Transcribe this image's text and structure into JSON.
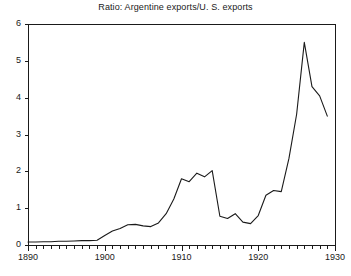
{
  "chart_data": {
    "type": "line",
    "title": "Ratio: Argentine exports/U. S. exports",
    "xlabel": "",
    "ylabel": "",
    "xlim": [
      1890,
      1930
    ],
    "ylim": [
      0,
      6
    ],
    "grid": false,
    "legend": null,
    "x_ticks_major": [
      1890,
      1900,
      1910,
      1920,
      1930
    ],
    "x_tick_labels": [
      "1890",
      "1900",
      "1910",
      "1920",
      "1930"
    ],
    "x_tick_minor_step": 1,
    "y_ticks": [
      0,
      1,
      2,
      3,
      4,
      5,
      6
    ],
    "y_tick_labels": [
      "0",
      "1",
      "2",
      "3",
      "4",
      "5",
      "6"
    ],
    "line_color": "#1a1a1a",
    "line_width": 1.1,
    "series": [
      {
        "name": "Ratio: Argentine exports/U. S. exports",
        "x": [
          1890,
          1891,
          1892,
          1893,
          1894,
          1895,
          1896,
          1897,
          1898,
          1899,
          1900,
          1901,
          1902,
          1903,
          1904,
          1905,
          1906,
          1907,
          1908,
          1909,
          1910,
          1911,
          1912,
          1913,
          1914,
          1915,
          1916,
          1917,
          1918,
          1919,
          1920,
          1921,
          1922,
          1923,
          1924,
          1925,
          1926,
          1927,
          1928,
          1929
        ],
        "values": [
          0.08,
          0.08,
          0.09,
          0.09,
          0.1,
          0.1,
          0.11,
          0.12,
          0.12,
          0.13,
          0.26,
          0.38,
          0.45,
          0.55,
          0.56,
          0.52,
          0.5,
          0.6,
          0.85,
          1.25,
          1.8,
          1.72,
          1.95,
          1.85,
          2.02,
          0.78,
          0.72,
          0.85,
          0.62,
          0.58,
          0.8,
          1.35,
          1.48,
          1.45,
          2.35,
          3.55,
          5.5,
          4.3,
          4.05,
          3.5
        ]
      }
    ]
  },
  "axes": {
    "left_px": 28,
    "right_px": 335,
    "top_px": 24,
    "bottom_px": 245
  }
}
